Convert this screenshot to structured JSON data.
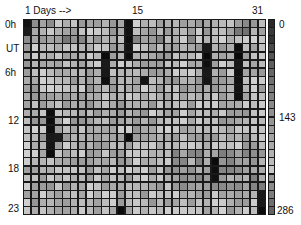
{
  "chart_data": {
    "type": "heatmap",
    "title": "",
    "xlabel": "Days -->",
    "ylabel": "UT",
    "x_tick_labels": [
      {
        "day": 1,
        "label": "1"
      },
      {
        "day": 15,
        "label": "15"
      },
      {
        "day": 31,
        "label": "31"
      }
    ],
    "y_tick_labels": [
      {
        "row": 0,
        "label": "0h"
      },
      {
        "row": 3,
        "label": "UT"
      },
      {
        "row": 6,
        "label": "6h"
      },
      {
        "row": 12,
        "label": "12"
      },
      {
        "row": 18,
        "label": "18"
      },
      {
        "row": 23,
        "label": "23"
      }
    ],
    "colorbar": {
      "min": 0,
      "mid": 143,
      "max": 286,
      "tick_labels": [
        "0",
        "143",
        "286"
      ],
      "colormap": "grayscale (0 = black)"
    },
    "n_days": 31,
    "n_hours": 24,
    "dark_cells_note": "Cells with near-zero values (black) listed as [day, hour]",
    "dark_cells": [
      [
        1,
        0
      ],
      [
        1,
        1
      ],
      [
        11,
        4
      ],
      [
        11,
        5
      ],
      [
        11,
        6
      ],
      [
        11,
        7
      ],
      [
        14,
        0
      ],
      [
        14,
        1
      ],
      [
        14,
        2
      ],
      [
        14,
        3
      ],
      [
        14,
        4
      ],
      [
        16,
        7
      ],
      [
        24,
        3
      ],
      [
        24,
        4
      ],
      [
        24,
        5
      ],
      [
        24,
        6
      ],
      [
        24,
        7
      ],
      [
        28,
        3
      ],
      [
        28,
        4
      ],
      [
        28,
        5
      ],
      [
        28,
        6
      ],
      [
        28,
        7
      ],
      [
        28,
        8
      ],
      [
        28,
        9
      ],
      [
        4,
        11
      ],
      [
        4,
        12
      ],
      [
        4,
        13
      ],
      [
        4,
        14
      ],
      [
        4,
        15
      ],
      [
        4,
        16
      ],
      [
        5,
        14
      ],
      [
        14,
        14
      ],
      [
        25,
        17
      ],
      [
        25,
        18
      ],
      [
        25,
        19
      ],
      [
        13,
        23
      ],
      [
        31,
        21
      ],
      [
        31,
        22
      ],
      [
        31,
        23
      ]
    ],
    "typical_value_range": [
      120,
      240
    ]
  },
  "labels": {
    "days_axis": "1  Days -->",
    "day15": "15",
    "day31": "31",
    "h0": "0h",
    "ut": "UT",
    "h6": "6h",
    "h12": "12",
    "h18": "18",
    "h23": "23",
    "cb0": "0",
    "cb143": "143",
    "cb286": "286"
  },
  "colorbar_blocks": [
    "#2a2a2a",
    "#3a3a3a",
    "#333333",
    "#4a4a4a",
    "#555555",
    "#5e5e5e",
    "#666666",
    "#707070",
    "#7a7a7a",
    "#808080",
    "#888888",
    "#8f8f8f",
    "#959595",
    "#9c9c9c",
    "#a3a3a3",
    "#aaaaaa",
    "#b2b2b2",
    "#bbbbbb",
    "#c8c8c8",
    "#9a9a9a",
    "#8a8a8a",
    "#7d7d7d",
    "#6f6f6f",
    "#646464"
  ]
}
